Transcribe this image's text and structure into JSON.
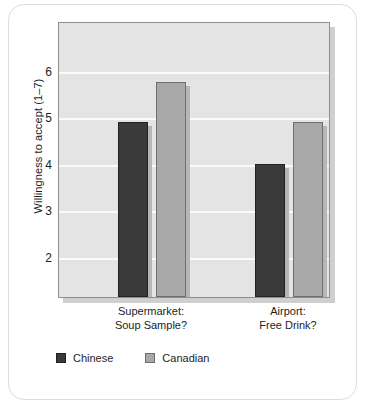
{
  "chart_data": {
    "type": "bar",
    "title": "",
    "xlabel": "",
    "ylabel": "Willingness to accept (1–7)",
    "categories": [
      "Supermarket: Soup Sample?",
      "Airport: Free Drink?"
    ],
    "category_lines": [
      [
        "Supermarket:",
        "Soup Sample?"
      ],
      [
        "Airport:",
        "Free Drink?"
      ]
    ],
    "series": [
      {
        "name": "Chinese",
        "color": "#3a3a3a",
        "values": [
          4.9,
          4.0
        ]
      },
      {
        "name": "Canadian",
        "color": "#a8a8a8",
        "values": [
          5.75,
          4.9
        ]
      }
    ],
    "yticks": [
      6,
      5,
      4,
      3,
      2
    ],
    "ytick_labels": [
      "6",
      "5",
      "4",
      "3",
      "2"
    ],
    "ylim": [
      1.14,
      7.07
    ],
    "grid": true,
    "legend_position": "bottom-left",
    "plot_background": "#e4e4e4",
    "gridline_color": "#fbfbfb"
  },
  "legend": {
    "items": [
      {
        "label": "Chinese"
      },
      {
        "label": "Canadian"
      }
    ]
  }
}
